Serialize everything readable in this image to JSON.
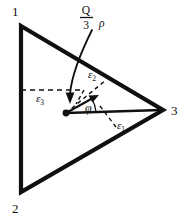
{
  "figure": {
    "background_color": "#ffffff",
    "stroke_color": "#101010",
    "vertices": [
      {
        "name": "vertex-1",
        "label": "1",
        "x": 21,
        "y": 26,
        "label_x": 12,
        "label_y": 16
      },
      {
        "name": "vertex-2",
        "label": "2",
        "x": 21,
        "y": 192,
        "label_x": 12,
        "label_y": 213
      },
      {
        "name": "vertex-3",
        "label": "3",
        "x": 163,
        "y": 110,
        "label_x": 171,
        "label_y": 114
      }
    ],
    "center_point": {
      "x": 66,
      "y": 113
    },
    "vector": {
      "label": "Q/3",
      "numerator": "Q",
      "denominator": "3",
      "density_symbol": "ρ",
      "tip_x": 97,
      "tip_y": 96
    },
    "angle": {
      "symbol": "φ",
      "label_x": 89,
      "label_y": 108
    },
    "regions": [
      {
        "name": "epsilon-1",
        "symbol": "ε",
        "subscript": "1",
        "label_x": 118,
        "label_y": 128
      },
      {
        "name": "epsilon-2",
        "symbol": "ε",
        "subscript": "2",
        "label_x": 90,
        "label_y": 77
      },
      {
        "name": "epsilon-3",
        "symbol": "ε",
        "subscript": "3",
        "label_x": 38,
        "label_y": 101
      }
    ]
  }
}
